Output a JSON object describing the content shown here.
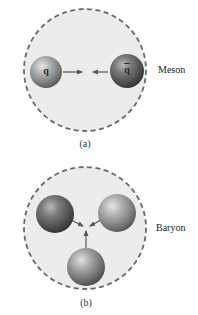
{
  "colors": {
    "background": "#ffffff",
    "hadron_fill": "#ececec",
    "hadron_border": "#6a6a6a",
    "quark_light": "#d6d6d6",
    "quark_mid": "#8a8a8a",
    "quark_dark": "#4a4a4a",
    "antiquark_dark": "#3a3a3a",
    "arrow": "#555555"
  },
  "panels": [
    {
      "id": "a",
      "label": "(a)",
      "particle_name": "Meson",
      "quarks": [
        {
          "symbol": "q",
          "cx": 46,
          "cy": 72,
          "r": 16
        },
        {
          "symbol": "q̄",
          "cx": 127,
          "cy": 71,
          "r": 17
        }
      ]
    },
    {
      "id": "b",
      "label": "(b)",
      "particle_name": "Baryon",
      "quarks": [
        {
          "symbol": "",
          "cx": 55,
          "cy": 214,
          "r": 19
        },
        {
          "symbol": "",
          "cx": 117,
          "cy": 213,
          "r": 19
        },
        {
          "symbol": "",
          "cx": 86,
          "cy": 267,
          "r": 19
        }
      ]
    }
  ],
  "meson": {
    "name": "Meson",
    "panel_label": "(a)",
    "quark_label": "q",
    "antiquark_label": "q"
  },
  "baryon": {
    "name": "Baryon",
    "panel_label": "(b)"
  }
}
